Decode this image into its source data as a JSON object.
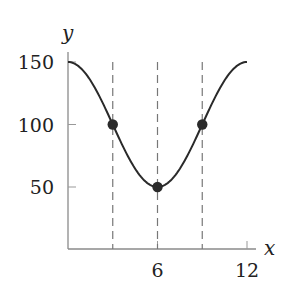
{
  "chart_data": {
    "type": "line",
    "title": "",
    "xlabel": "x",
    "ylabel": "y",
    "xlim": [
      0,
      12.5
    ],
    "ylim": [
      0,
      150
    ],
    "x_ticks": [
      6,
      12
    ],
    "x_tick_labels": [
      "6",
      "12"
    ],
    "y_ticks": [
      50,
      100,
      150
    ],
    "y_tick_labels": [
      "50",
      "100",
      "150"
    ],
    "grid": false,
    "legend": null,
    "series": [
      {
        "name": "curve",
        "function": "y = 100 + 50*cos(pi*x/6)",
        "x": [
          0,
          1,
          2,
          3,
          4,
          5,
          6,
          7,
          8,
          9,
          10,
          11,
          12
        ],
        "values": [
          150,
          143.3,
          125,
          100,
          75,
          56.7,
          50,
          56.7,
          75,
          100,
          125,
          143.3,
          150
        ]
      }
    ],
    "marked_points": [
      {
        "x": 3,
        "y": 100
      },
      {
        "x": 6,
        "y": 50
      },
      {
        "x": 9,
        "y": 100
      }
    ],
    "dashed_vertical_lines": [
      3,
      6,
      9
    ],
    "colors": {
      "curve": "#2a2a2a",
      "axis": "#888888",
      "dashed": "#777777",
      "points": "#2a2a2a"
    }
  }
}
